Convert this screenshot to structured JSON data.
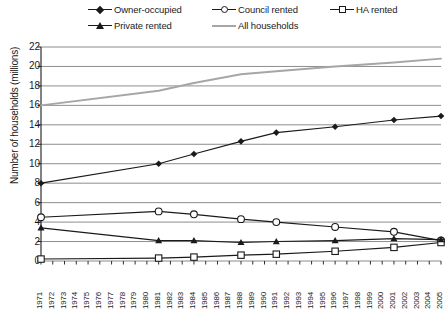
{
  "chart_data": {
    "type": "line",
    "title": "",
    "xlabel": "",
    "ylabel": "Number of households (millions)",
    "ylim": [
      0,
      22
    ],
    "ytick_step": 2,
    "yticks": [
      22,
      20,
      18,
      16,
      14,
      12,
      10,
      8,
      6,
      4,
      2,
      0
    ],
    "grid": "horizontal",
    "legend_position": "top",
    "xlim": [
      1971,
      2005
    ],
    "xticks": [
      "1971",
      "1972",
      "1973",
      "1974",
      "1975",
      "1976",
      "1977",
      "1978",
      "1979",
      "1980",
      "1981",
      "1982",
      "1983",
      "1984",
      "1985",
      "1986",
      "1987",
      "1988",
      "1989",
      "1990",
      "1991",
      "1992",
      "1993",
      "1994",
      "1995",
      "1996",
      "1997",
      "1998",
      "1999",
      "2000",
      "2001",
      "2002",
      "2003",
      "2004",
      "2005"
    ],
    "x": [
      1971,
      1981,
      1984,
      1988,
      1991,
      1996,
      2001,
      2005
    ],
    "series": [
      {
        "name": "Owner-occupied",
        "marker": "diamond-filled",
        "color": "#1a1a1a",
        "values": [
          8.0,
          10.0,
          11.0,
          12.3,
          13.2,
          13.8,
          14.5,
          14.9
        ]
      },
      {
        "name": "Council rented",
        "marker": "circle-open",
        "color": "#1a1a1a",
        "values": [
          4.5,
          5.1,
          4.8,
          4.3,
          4.0,
          3.5,
          3.0,
          2.1
        ]
      },
      {
        "name": "HA rented",
        "marker": "square-open",
        "color": "#1a1a1a",
        "values": [
          0.2,
          0.3,
          0.4,
          0.6,
          0.7,
          1.0,
          1.4,
          1.9
        ]
      },
      {
        "name": "Private rented",
        "marker": "triangle-filled",
        "color": "#1a1a1a",
        "values": [
          3.4,
          2.1,
          2.1,
          1.9,
          2.0,
          2.1,
          2.3,
          2.2
        ]
      },
      {
        "name": "All households",
        "marker": "none",
        "color": "#a6a6a6",
        "x": [
          1971,
          1981,
          1984,
          1988,
          1991,
          1996,
          2001,
          2005
        ],
        "values": [
          16.0,
          17.5,
          18.3,
          19.2,
          19.5,
          20.0,
          20.4,
          20.8
        ]
      }
    ]
  },
  "legend": {
    "items": [
      {
        "label": "Owner-occupied",
        "marker": "diamond-filled"
      },
      {
        "label": "Council rented",
        "marker": "circle-open"
      },
      {
        "label": "HA rented",
        "marker": "square-open"
      },
      {
        "label": "Private rented",
        "marker": "triangle-filled"
      },
      {
        "label": "All households",
        "marker": "line-grey"
      }
    ]
  }
}
